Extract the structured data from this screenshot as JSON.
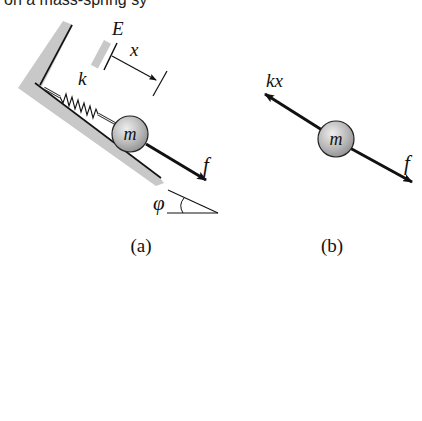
{
  "top_fragment": {
    "text": "on a mass-spring sy"
  },
  "panel_a": {
    "caption": "(a)",
    "labels": {
      "reference": "E",
      "displacement": "x",
      "spring_constant": "k",
      "mass": "m",
      "force": "f",
      "angle": "φ"
    }
  },
  "panel_b": {
    "caption": "(b)",
    "labels": {
      "spring_force": "kx",
      "mass": "m",
      "force": "f"
    }
  },
  "colors": {
    "wall_fill": "#c8c8c8",
    "line": "#111111",
    "mass_fill": "#b5b5b5",
    "mass_highlight": "#e6e6e6",
    "background": "#ffffff"
  }
}
